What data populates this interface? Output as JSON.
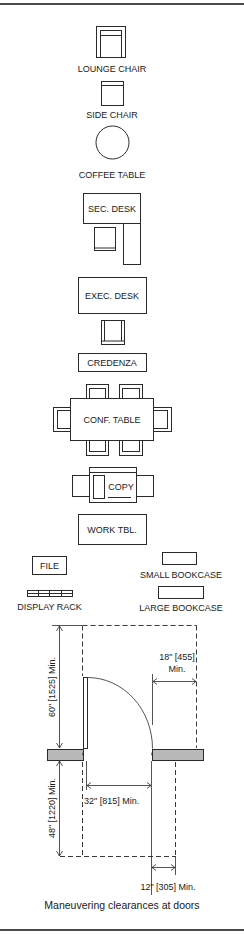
{
  "frame": {
    "border_color": "#4a4a4a",
    "background": "#ffffff"
  },
  "furniture": {
    "lounge_chair": {
      "label": "LOUNGE CHAIR"
    },
    "side_chair": {
      "label": "SIDE CHAIR"
    },
    "coffee_table": {
      "label": "COFFEE TABLE"
    },
    "sec_desk": {
      "label": "SEC. DESK"
    },
    "exec_desk": {
      "label": "EXEC. DESK"
    },
    "credenza": {
      "label": "CREDENZA"
    },
    "conf_table": {
      "label": "CONF. TABLE"
    },
    "copy": {
      "label": "COPY"
    },
    "work_table": {
      "label": "WORK TBL."
    },
    "file": {
      "label": "FILE"
    },
    "small_bookcase": {
      "label": "SMALL BOOKCASE"
    },
    "display_rack": {
      "label": "DISPLAY RACK"
    },
    "large_bookcase": {
      "label": "LARGE BOOKCASE"
    }
  },
  "door_diagram": {
    "dims": {
      "depth_push_side": "60\" [1525] Min.",
      "latch_side_pull": "18\" [455]",
      "latch_side_pull_suffix": "Min.",
      "clear_width": "32\" [815] Min.",
      "depth_pull_side": "48\" [1220] Min.",
      "latch_side_push": "12\" [305] Min."
    },
    "caption": "Maneuvering clearances at doors",
    "wall_fill": "#b9b9b9"
  }
}
